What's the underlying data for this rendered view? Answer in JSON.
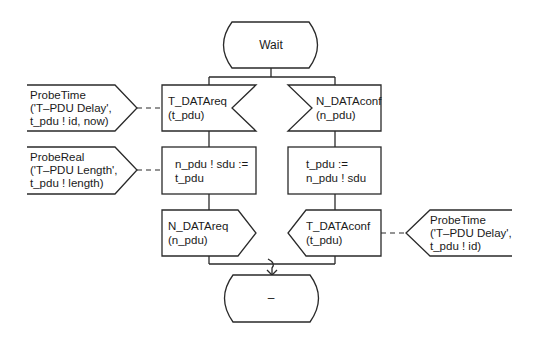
{
  "diagram": {
    "type": "SDL process diagram",
    "states": {
      "start": {
        "label": "Wait"
      },
      "end": {
        "label": "–"
      }
    },
    "left_branch": {
      "input": {
        "line1": "T_DATAreq",
        "line2": "(t_pdu)"
      },
      "task": {
        "line1": "n_pdu ! sdu :=",
        "line2": "t_pdu"
      },
      "output": {
        "line1": "N_DATAreq",
        "line2": "(n_pdu)"
      }
    },
    "right_branch": {
      "input": {
        "line1": "N_DATAconf",
        "line2": "(n_pdu)"
      },
      "task": {
        "line1": "t_pdu :=",
        "line2": "n_pdu ! sdu"
      },
      "output": {
        "line1": "T_DATAconf",
        "line2": "(t_pdu)"
      }
    },
    "probes": [
      {
        "attached_to": "T_DATAreq",
        "line1": "ProbeTime",
        "line2": "('T–PDU Delay',",
        "line3": "t_pdu ! id, now)"
      },
      {
        "attached_to": "n_pdu ! sdu := t_pdu",
        "line1": "ProbeReal",
        "line2": "('T–PDU Length',",
        "line3": "t_pdu ! length)"
      },
      {
        "attached_to": "T_DATAconf",
        "line1": "ProbeTime",
        "line2": "('T–PDU Delay',",
        "line3": "t_pdu ! id)"
      }
    ],
    "colors": {
      "stroke": "#2a2a2a",
      "background": "#ffffff",
      "text": "#1a1a1a"
    }
  }
}
